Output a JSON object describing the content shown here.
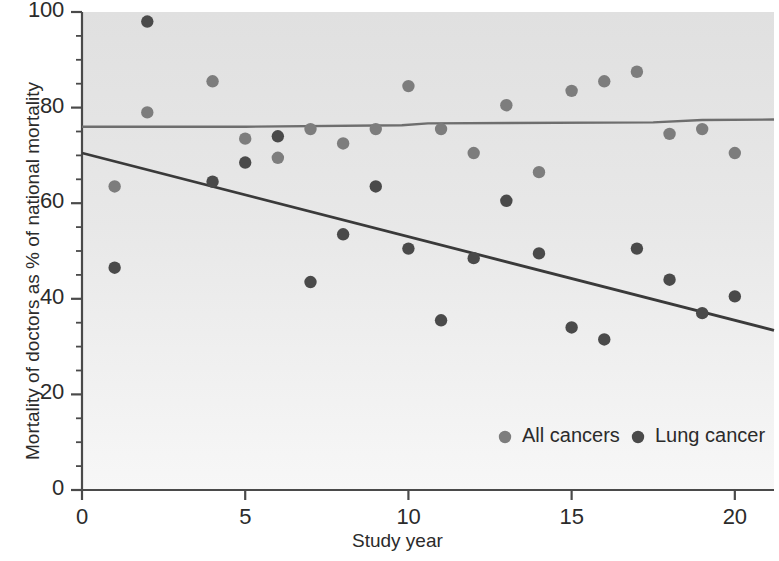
{
  "chart_data": {
    "type": "scatter",
    "title": "",
    "xlabel": "Study year",
    "ylabel": "Mortality of doctors as % of national mortality",
    "xlim": [
      0,
      21.2
    ],
    "ylim": [
      0,
      100
    ],
    "xticks": [
      0,
      5,
      10,
      15,
      20
    ],
    "xtick_labels": [
      "0",
      "5",
      "10",
      "15",
      "20"
    ],
    "yticks": [
      0,
      20,
      40,
      60,
      80,
      100
    ],
    "ytick_labels": [
      "0",
      "20",
      "40",
      "60",
      "80",
      "100"
    ],
    "yminor_step": 5,
    "grid": false,
    "legend_position": "lower right",
    "series": [
      {
        "name": "All cancers",
        "marker": "circle",
        "color": "#7d7d7d",
        "points": [
          {
            "x": 1,
            "y": 63.5
          },
          {
            "x": 2,
            "y": 79.0
          },
          {
            "x": 4,
            "y": 85.5
          },
          {
            "x": 5,
            "y": 73.5
          },
          {
            "x": 6,
            "y": 69.5
          },
          {
            "x": 7,
            "y": 75.5
          },
          {
            "x": 8,
            "y": 72.5
          },
          {
            "x": 9,
            "y": 75.5
          },
          {
            "x": 10,
            "y": 84.5
          },
          {
            "x": 11,
            "y": 75.5
          },
          {
            "x": 12,
            "y": 70.5
          },
          {
            "x": 13,
            "y": 80.5
          },
          {
            "x": 14,
            "y": 66.5
          },
          {
            "x": 15,
            "y": 83.5
          },
          {
            "x": 16,
            "y": 85.5
          },
          {
            "x": 17,
            "y": 87.5
          },
          {
            "x": 18,
            "y": 74.5
          },
          {
            "x": 19,
            "y": 75.5
          },
          {
            "x": 20,
            "y": 70.5
          }
        ]
      },
      {
        "name": "Lung cancer",
        "marker": "circle",
        "color": "#4a4a4a",
        "points": [
          {
            "x": 1,
            "y": 46.5
          },
          {
            "x": 2,
            "y": 98.0
          },
          {
            "x": 4,
            "y": 64.5
          },
          {
            "x": 5,
            "y": 68.5
          },
          {
            "x": 6,
            "y": 74.0
          },
          {
            "x": 7,
            "y": 43.5
          },
          {
            "x": 8,
            "y": 53.5
          },
          {
            "x": 9,
            "y": 63.5
          },
          {
            "x": 10,
            "y": 50.5
          },
          {
            "x": 11,
            "y": 35.5
          },
          {
            "x": 12,
            "y": 48.5
          },
          {
            "x": 13,
            "y": 60.5
          },
          {
            "x": 14,
            "y": 49.5
          },
          {
            "x": 15,
            "y": 34.0
          },
          {
            "x": 16,
            "y": 31.5
          },
          {
            "x": 17,
            "y": 50.5
          },
          {
            "x": 18,
            "y": 44.0
          },
          {
            "x": 19,
            "y": 37.0
          },
          {
            "x": 20,
            "y": 40.5
          }
        ]
      }
    ],
    "trend_lines": [
      {
        "name": "All cancers trend",
        "color": "#6e6e6e",
        "width": 2.4,
        "vertices": [
          {
            "x": 0.0,
            "y": 76.0
          },
          {
            "x": 5.0,
            "y": 76.0
          },
          {
            "x": 9.8,
            "y": 76.3
          },
          {
            "x": 10.6,
            "y": 76.7
          },
          {
            "x": 17.5,
            "y": 76.9
          },
          {
            "x": 19.0,
            "y": 77.4
          },
          {
            "x": 21.2,
            "y": 77.5
          }
        ]
      },
      {
        "name": "Lung cancer trend",
        "color": "#3a3a3a",
        "width": 2.8,
        "vertices": [
          {
            "x": 0.0,
            "y": 70.5
          },
          {
            "x": 21.2,
            "y": 33.4
          }
        ]
      }
    ],
    "plot_background": "#e2e2e2",
    "plot_background_bottom": "#f2f2f2"
  },
  "legend": {
    "entries": [
      {
        "label": "All cancers",
        "color": "#7d7d7d"
      },
      {
        "label": "Lung cancer",
        "color": "#4a4a4a"
      }
    ]
  },
  "axes": {
    "x_title": "Study year",
    "y_title": "Mortality of doctors as % of national mortality",
    "axis_color": "#4a4a4a"
  }
}
